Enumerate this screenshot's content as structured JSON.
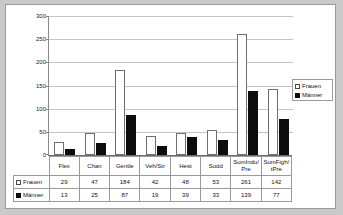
{
  "chart_data": {
    "type": "bar",
    "title": "",
    "xlabel": "",
    "ylabel": "",
    "ylim": [
      0,
      300
    ],
    "yticks": [
      0,
      50,
      100,
      150,
      200,
      250,
      300
    ],
    "grid": true,
    "legend_position": "right",
    "categories": [
      "Flex",
      "Chan",
      "Gentle",
      "Veh/Str",
      "Hest",
      "Sudd",
      "SumIndu/Pre",
      "SumFigh/tPre"
    ],
    "series": [
      {
        "name": "Frauen",
        "values": [
          29,
          47,
          184,
          42,
          48,
          53,
          261,
          142
        ],
        "color": "#ffffff",
        "swatch": "open"
      },
      {
        "name": "Männer",
        "values": [
          13,
          25,
          87,
          19,
          39,
          33,
          139,
          77
        ],
        "color": "#0d0d0d",
        "swatch": "solid"
      }
    ],
    "data_table": {
      "row_headers": [
        "Frauen",
        "Männer"
      ],
      "column_headers": [
        "Flex",
        "Chan",
        "Gentle",
        "Veh/Str",
        "Hest",
        "Sudd",
        "SumIndu/Pre",
        "SumFigh/tPre"
      ],
      "rows": [
        [
          "29",
          "47",
          "184",
          "42",
          "48",
          "53",
          "261",
          "142"
        ],
        [
          "13",
          "25",
          "87",
          "19",
          "39",
          "33",
          "139",
          "77"
        ]
      ]
    },
    "colors": {
      "frauen": "#ffffff",
      "maenner": "#0d0d0d",
      "gridline": "#c4c4c4",
      "axis": "#6b6b6b",
      "background": "#ffffff",
      "page_background": "#c9c9c9"
    }
  }
}
